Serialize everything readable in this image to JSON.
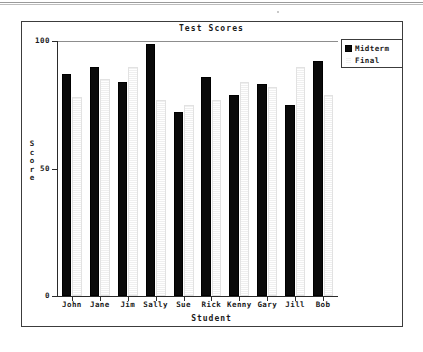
{
  "chart_data": {
    "type": "bar",
    "title": "Test Scores",
    "xlabel": "Student",
    "ylabel": "Score",
    "categories": [
      "John",
      "Jane",
      "Jim",
      "Sally",
      "Sue",
      "Rick",
      "Kenny",
      "Gary",
      "Jill",
      "Bob"
    ],
    "series": [
      {
        "name": "Midterm",
        "color": "#0a0a0a",
        "values": [
          87,
          90,
          84,
          99,
          72,
          86,
          79,
          83,
          75,
          92
        ]
      },
      {
        "name": "Final",
        "color": "#f2f2f2",
        "values": [
          78,
          85,
          90,
          77,
          75,
          77,
          84,
          82,
          90,
          79
        ]
      }
    ],
    "ylim": [
      0,
      100
    ],
    "yticks": [
      0,
      50,
      100
    ],
    "ytick_labels": [
      "0",
      "50",
      "100"
    ],
    "grid": false,
    "legend_position": "top-right"
  },
  "legend": {
    "entries": [
      {
        "label": "Midterm",
        "swatch": "midterm-swatch"
      },
      {
        "label": "Final",
        "swatch": "final-swatch"
      }
    ]
  }
}
